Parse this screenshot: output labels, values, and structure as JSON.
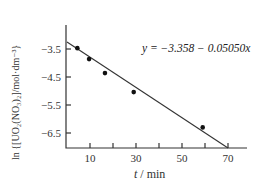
{
  "chart_data": {
    "type": "scatter",
    "title": "",
    "xlabel": "t / min",
    "ylabel": "ln {[UO2(NO3)2]/mol·dm^-3}",
    "xlim": [
      0,
      78
    ],
    "ylim": [
      -7.0,
      -2.9
    ],
    "x_ticks": [
      10,
      20,
      30,
      40,
      50,
      60,
      70
    ],
    "x_tick_labels": [
      "10",
      "",
      "30",
      "",
      "50",
      "",
      "70"
    ],
    "y_ticks": [
      -3.5,
      -4.5,
      -5.5,
      -6.5
    ],
    "y_tick_labels": [
      "−3.5",
      "−4.5",
      "−5.5",
      "−6.5"
    ],
    "grid": false,
    "series": [
      {
        "name": "data",
        "x": [
          4.5,
          9.6,
          16.5,
          29,
          59
        ],
        "y": [
          -3.47,
          -3.86,
          -4.36,
          -5.04,
          -6.3
        ]
      }
    ],
    "fit_line": {
      "equation": "y = −3.358 − 0.05050x",
      "intercept": -3.358,
      "slope": -0.0505,
      "x_range": [
        0,
        70
      ]
    },
    "annotations": [
      "y = −3.358 − 0.05050x"
    ]
  },
  "labels": {
    "equation": "y = −3.358 − 0.05050x",
    "xlabel_t": "t",
    "xlabel_unit": " / min",
    "ylabel": "ln {[UO₂(NO₃)₂]/mol·dm⁻³}"
  }
}
